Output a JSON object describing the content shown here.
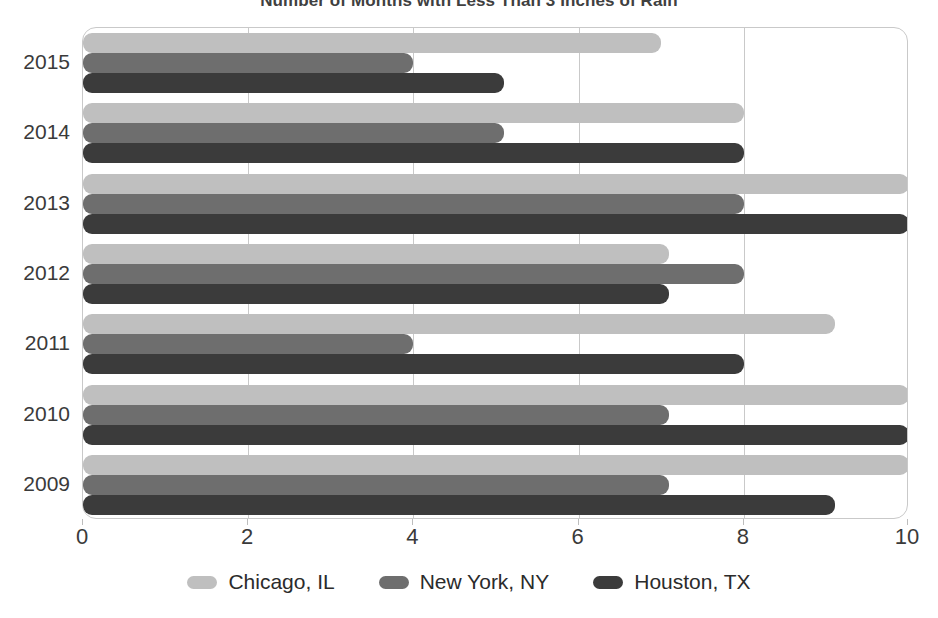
{
  "chart_data": {
    "type": "bar",
    "orientation": "horizontal",
    "title": "Number of Months with Less Than 3 Inches of Rain",
    "xlabel": "",
    "ylabel": "",
    "categories": [
      "2015",
      "2014",
      "2013",
      "2012",
      "2011",
      "2010",
      "2009"
    ],
    "series": [
      {
        "name": "Chicago, IL",
        "color": "#bfbfbf",
        "values": [
          7,
          8,
          10,
          7.1,
          9.1,
          10,
          10
        ]
      },
      {
        "name": "New York, NY",
        "color": "#6e6e6e",
        "values": [
          4,
          5.1,
          8,
          8,
          4,
          7.1,
          7.1
        ]
      },
      {
        "name": "Houston, TX",
        "color": "#3b3b3b",
        "values": [
          5.1,
          8,
          10,
          7.1,
          8,
          10,
          9.1
        ]
      }
    ],
    "xlim": [
      0,
      10
    ],
    "xticks": [
      0,
      2,
      4,
      6,
      8,
      10
    ],
    "xtick_labels": [
      "0",
      "2",
      "4",
      "6",
      "8",
      "10"
    ],
    "grid": true,
    "grid_axis": "x",
    "legend_position": "bottom",
    "frame_color": "#c9c9c9",
    "background": "#ffffff"
  },
  "axis": {
    "x_tick_labels": [
      "0",
      "2",
      "4",
      "6",
      "8",
      "10"
    ],
    "y_tick_labels": [
      "2015",
      "2014",
      "2013",
      "2012",
      "2011",
      "2010",
      "2009"
    ]
  },
  "legend": {
    "items": [
      {
        "label": "Chicago, IL",
        "color": "#bfbfbf"
      },
      {
        "label": "New York, NY",
        "color": "#6e6e6e"
      },
      {
        "label": "Houston, TX",
        "color": "#3b3b3b"
      }
    ]
  }
}
